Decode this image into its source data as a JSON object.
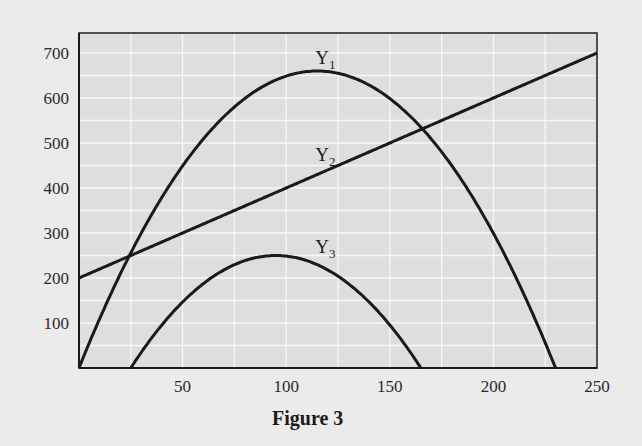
{
  "figure": {
    "caption": "Figure 3",
    "background": "#ebebeb",
    "plot_background": "#dedede",
    "grid_color": "#f7f7f7",
    "line_color": "#1a1a1a"
  },
  "chart_data": {
    "type": "line",
    "title": "Figure 3",
    "xlabel": "",
    "ylabel": "",
    "xlim": [
      0,
      250
    ],
    "ylim": [
      0,
      750
    ],
    "grid": true,
    "legend": "inline labels near curves",
    "x_ticks": [
      50,
      100,
      150,
      200,
      250
    ],
    "y_ticks": [
      100,
      200,
      300,
      400,
      500,
      600,
      700
    ],
    "x_tick_labels": [
      "50",
      "100",
      "150",
      "200",
      "250"
    ],
    "y_tick_labels": [
      "100",
      "200",
      "300",
      "400",
      "500",
      "600",
      "700"
    ],
    "series": [
      {
        "name": "Y1",
        "label": "Y",
        "subscript": "1",
        "shape": "downward parabola",
        "x": [
          0,
          25,
          50,
          75,
          100,
          115,
          125,
          150,
          165,
          175,
          200,
          230
        ],
        "values": [
          0,
          256,
          449,
          580,
          649,
          660,
          655,
          599,
          535,
          480,
          299,
          0
        ]
      },
      {
        "name": "Y2",
        "label": "Y",
        "subscript": "2",
        "shape": "straight line",
        "x": [
          0,
          25,
          50,
          100,
          150,
          165,
          200,
          250
        ],
        "values": [
          200,
          250,
          300,
          400,
          500,
          530,
          600,
          700
        ]
      },
      {
        "name": "Y3",
        "label": "Y",
        "subscript": "3",
        "shape": "downward parabola",
        "x": [
          25,
          50,
          75,
          95,
          100,
          125,
          150,
          165
        ],
        "values": [
          0,
          147,
          230,
          250,
          249,
          204,
          96,
          0
        ]
      }
    ],
    "annotations": [
      {
        "text": "Y1",
        "x": 115,
        "y": 715
      },
      {
        "text": "Y2",
        "x": 115,
        "y": 500
      },
      {
        "text": "Y3",
        "x": 115,
        "y": 295
      }
    ]
  }
}
